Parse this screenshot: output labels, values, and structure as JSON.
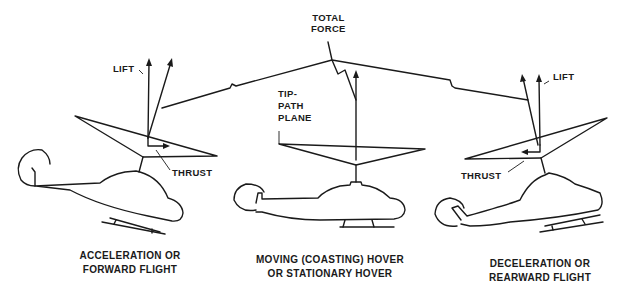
{
  "figure": {
    "total_force_label": [
      "TOTAL",
      "FORCE"
    ],
    "tip_path_plane_label": [
      "TIP-",
      "PATH",
      "PLANE"
    ],
    "panels": [
      {
        "id": "acceleration",
        "lift_label": "LIFT",
        "thrust_label": "THRUST",
        "caption": [
          "ACCELERATION OR",
          "FORWARD FLIGHT"
        ]
      },
      {
        "id": "hover",
        "caption": [
          "MOVING (COASTING) HOVER",
          "OR STATIONARY HOVER"
        ]
      },
      {
        "id": "deceleration",
        "lift_label": "LIFT",
        "thrust_label": "THRUST",
        "caption": [
          "DECELERATION OR",
          "REARWARD FLIGHT"
        ]
      }
    ]
  }
}
